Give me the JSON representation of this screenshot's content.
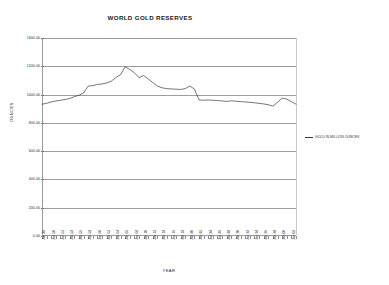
{
  "chart_data": {
    "type": "line",
    "title": "WORLD GOLD RESERVES",
    "xlabel": "YEAR",
    "ylabel": "OUNCES",
    "ylim": [
      0,
      1400
    ],
    "ytick_step": 200,
    "ytick_labels": [
      "0.00",
      "200.00",
      "400.00",
      "600.00",
      "800.00",
      "1000.00",
      "1200.00",
      "1400.00"
    ],
    "ytick_values": [
      0,
      200,
      400,
      600,
      800,
      1000,
      1200,
      1400
    ],
    "grid": "horizontal",
    "legend_position": "right",
    "series": [
      {
        "name": "GOLD IN MILLION OUNCES",
        "color": "#3a3a3a",
        "x": [
          "Jan-48",
          "Jan-49",
          "Jan-50",
          "Jan-51",
          "Jan-52",
          "Jan-53",
          "Jan-54",
          "Jan-55",
          "Jan-56",
          "Jan-57",
          "Jan-58",
          "Jan-59",
          "Jan-60",
          "Jan-61",
          "Jan-62",
          "Jan-63",
          "Jan-64",
          "Jan-65",
          "Jan-66",
          "Jan-67",
          "Jan-68",
          "Jan-69",
          "Jan-70",
          "Jan-71",
          "Jan-72",
          "Jan-73",
          "Jan-74",
          "Jan-75",
          "Jan-76",
          "Jan-77",
          "Jan-78",
          "Jan-79",
          "Jan-80",
          "Jan-81",
          "Jan-82",
          "Jan-83",
          "Jan-84",
          "Jan-85",
          "Jan-86",
          "Jan-87",
          "Jan-88",
          "Jan-89",
          "Jan-90",
          "Jan-91",
          "Jan-92",
          "Jan-93",
          "Jan-94",
          "Jan-95",
          "Jan-96",
          "Jan-97",
          "Jan-98",
          "Jan-99",
          "Jan-00",
          "Jan-01",
          "Jan-02",
          "Jan-03"
        ],
        "values": [
          932,
          938,
          948,
          955,
          960,
          965,
          972,
          985,
          995,
          1012,
          1060,
          1063,
          1072,
          1075,
          1082,
          1095,
          1120,
          1140,
          1196,
          1178,
          1155,
          1120,
          1135,
          1110,
          1085,
          1060,
          1048,
          1042,
          1040,
          1038,
          1036,
          1042,
          1060,
          1040,
          962,
          960,
          962,
          960,
          958,
          955,
          952,
          956,
          953,
          950,
          948,
          945,
          942,
          938,
          934,
          928,
          918,
          945,
          975,
          968,
          950,
          932
        ]
      }
    ],
    "xtick_labels": [
      "Jan-48",
      "Jan-50",
      "Jan-52",
      "Jan-54",
      "Jan-56",
      "Jan-58",
      "Jan-60",
      "Jan-62",
      "Jan-64",
      "Jan-66",
      "Jan-68",
      "Jan-70",
      "Jan-72",
      "Jan-74",
      "Jan-76",
      "Jan-78",
      "Jan-80",
      "Jan-82",
      "Jan-84",
      "Jan-86",
      "Jan-88",
      "Jan-90",
      "Jan-92",
      "Jan-94",
      "Jan-96",
      "Jan-98",
      "Jan-00",
      "Jan-02"
    ]
  },
  "legend": {
    "entries": [
      {
        "label": "GOLD IN MILLION OUNCES",
        "color": "#3a3a3a"
      }
    ]
  },
  "colors": {
    "series_line": "#3a3a3a",
    "gridline": "#9d9d9d",
    "axis": "#9a9a9a",
    "text": "#1f1f1f",
    "background": "#ffffff"
  }
}
